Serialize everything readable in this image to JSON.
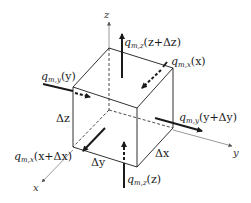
{
  "diagram": {
    "axes": {
      "x_label": "x",
      "y_label": "y",
      "z_label": "z"
    },
    "dimensions": {
      "dx": "Δx",
      "dy": "Δy",
      "dz": "Δz"
    },
    "fluxes": {
      "z_top": {
        "q": "q",
        "sub": "m,z",
        "arg": "(z+Δz)"
      },
      "z_bottom": {
        "q": "q",
        "sub": "m,z",
        "arg": "(z)"
      },
      "x_back": {
        "q": "q",
        "sub": "m,x",
        "arg": "(x)"
      },
      "x_front": {
        "q": "q",
        "sub": "m,x",
        "arg": "(x+Δx)"
      },
      "y_left": {
        "q": "q",
        "sub": "m,y",
        "arg": "(y)"
      },
      "y_right": {
        "q": "q",
        "sub": "m,y",
        "arg": "(y+Δy)"
      }
    },
    "colors": {
      "line": "#1a1a1a",
      "axis": "#555555",
      "background": "#ffffff"
    }
  }
}
